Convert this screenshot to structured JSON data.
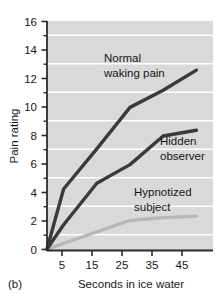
{
  "figure": {
    "panel_label": "(b)"
  },
  "chart_data": {
    "type": "line",
    "title": "",
    "xlabel": "Seconds in ice water",
    "ylabel": "Pain rating",
    "xlim": [
      0,
      50
    ],
    "ylim": [
      0,
      16
    ],
    "xticks": [
      5,
      15,
      25,
      35,
      45
    ],
    "xtick_labels": [
      "5",
      "15",
      "25",
      "35",
      "45"
    ],
    "yticks": [
      0,
      2,
      4,
      6,
      8,
      10,
      12,
      14,
      16
    ],
    "ytick_labels": [
      "0",
      "2",
      "4",
      "6",
      "8",
      "10",
      "12",
      "14",
      "16"
    ],
    "yminor_ticks": [
      1,
      3,
      5,
      7,
      9,
      11,
      13,
      15
    ],
    "grid": "horizontal-white-gridlines",
    "plot_background": "#d9d9d9",
    "legend": "inline-annotations",
    "series": [
      {
        "name": "Normal waking pain",
        "label": "Normal\nwaking pain",
        "label_line1": "Normal",
        "label_line2": "waking pain",
        "color": "#3a3a3a",
        "x": [
          0,
          5,
          15,
          25,
          35,
          45
        ],
        "values": [
          0.1,
          4.3,
          7.1,
          10.0,
          11.2,
          12.6
        ]
      },
      {
        "name": "Hidden observer",
        "label": "Hidden\nobserver",
        "label_line1": "Hidden",
        "label_line2": "observer",
        "color": "#3a3a3a",
        "x": [
          0,
          5,
          15,
          25,
          35,
          45
        ],
        "values": [
          0.1,
          1.8,
          4.7,
          6.0,
          8.0,
          8.4
        ]
      },
      {
        "name": "Hypnotized subject",
        "label": "Hypnotized\nsubject",
        "label_line1": "Hypnotized",
        "label_line2": "subject",
        "color": "#b8b8b8",
        "x": [
          0,
          5,
          15,
          25,
          35,
          45
        ],
        "values": [
          0.1,
          0.5,
          1.3,
          2.1,
          2.3,
          2.4
        ]
      }
    ]
  }
}
